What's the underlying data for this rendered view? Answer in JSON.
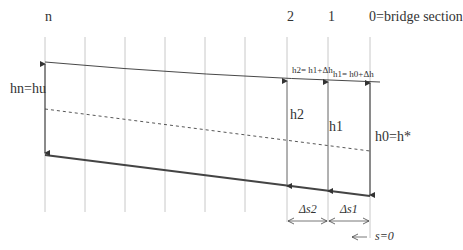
{
  "diagram": {
    "sections": {
      "n": "n",
      "s2": "2",
      "s1": "1",
      "s0": "0=bridge section"
    },
    "depth_labels": {
      "hn": "hn=hu",
      "h2": "h2",
      "h1": "h1",
      "h0": "h0=h*"
    },
    "surface_labels": {
      "h2_eq": "h2= h1+Δh",
      "h1_eq": "h1= h0+Δh"
    },
    "distance_labels": {
      "ds2": "Δs2",
      "ds1": "Δs1",
      "s0": "s=0"
    },
    "colors": {
      "grid": "#c8c8c8",
      "line": "#333333",
      "bed": "#444444",
      "background": "#ffffff"
    },
    "elements": {
      "grid_lines_x": [
        45,
        85,
        125,
        165,
        205,
        245,
        287,
        328,
        370
      ],
      "water_surface": "solid thin line from n to 0, slightly curved",
      "critical_depth_line": "dashed line",
      "channel_bed": "thick solid line sloping down to the right"
    }
  }
}
